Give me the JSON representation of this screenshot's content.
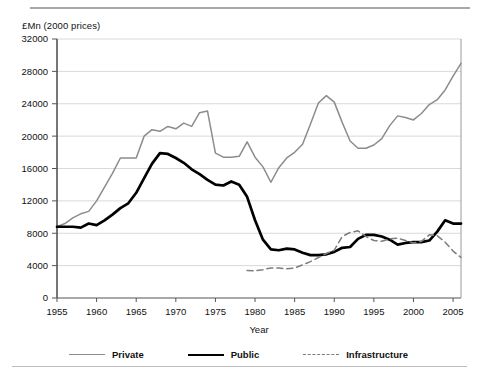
{
  "figure": {
    "y_axis_unit_label": "£Mn (2000 prices)",
    "x_axis_title": "Year"
  },
  "legend": {
    "position": "bottom",
    "items": [
      {
        "label": "Private",
        "color": "#8c8c8c",
        "style": "solid",
        "icon": "line-swatch-icon"
      },
      {
        "label": "Public",
        "color": "#000000",
        "style": "solid-bold",
        "icon": "line-swatch-icon"
      },
      {
        "label": "Infrastructure",
        "color": "#7d7d7d",
        "style": "dashed",
        "icon": "dashed-line-swatch-icon"
      }
    ]
  },
  "chart_data": {
    "type": "line",
    "title": "",
    "subtitle": "",
    "xlabel": "Year",
    "ylabel": "£Mn (2000 prices)",
    "xlim": [
      1955,
      2006
    ],
    "ylim": [
      0,
      32000
    ],
    "ytick_step": 4000,
    "yticks": [
      0,
      4000,
      8000,
      12000,
      16000,
      20000,
      24000,
      28000,
      32000
    ],
    "xticks": [
      1955,
      1960,
      1965,
      1970,
      1975,
      1980,
      1985,
      1990,
      1995,
      2000,
      2005
    ],
    "grid": "horizontal",
    "legend_position": "bottom",
    "series": [
      {
        "name": "Private",
        "color": "#8c8c8c",
        "style": "solid",
        "x": [
          1955,
          1956,
          1957,
          1958,
          1959,
          1960,
          1961,
          1962,
          1963,
          1964,
          1965,
          1966,
          1967,
          1968,
          1969,
          1970,
          1971,
          1972,
          1973,
          1974,
          1975,
          1976,
          1977,
          1978,
          1979,
          1980,
          1981,
          1982,
          1983,
          1984,
          1985,
          1986,
          1987,
          1988,
          1989,
          1990,
          1991,
          1992,
          1993,
          1994,
          1995,
          1996,
          1997,
          1998,
          1999,
          2000,
          2001,
          2002,
          2003,
          2004,
          2005,
          2006
        ],
        "y": [
          8800,
          9200,
          9900,
          10400,
          10700,
          12000,
          13700,
          15400,
          17300,
          17300,
          17300,
          20000,
          20800,
          20600,
          21200,
          20900,
          21600,
          21200,
          22900,
          23100,
          17900,
          17400,
          17400,
          17500,
          19300,
          17400,
          16200,
          14300,
          16100,
          17300,
          18000,
          19000,
          21500,
          24100,
          25000,
          24200,
          21700,
          19400,
          18500,
          18500,
          18900,
          19700,
          21300,
          22500,
          22300,
          22000,
          22800,
          23900,
          24500,
          25700,
          27400,
          29000
        ]
      },
      {
        "name": "Public",
        "color": "#000000",
        "style": "solid-bold",
        "x": [
          1955,
          1956,
          1957,
          1958,
          1959,
          1960,
          1961,
          1962,
          1963,
          1964,
          1965,
          1966,
          1967,
          1968,
          1969,
          1970,
          1971,
          1972,
          1973,
          1974,
          1975,
          1976,
          1977,
          1978,
          1979,
          1980,
          1981,
          1982,
          1983,
          1984,
          1985,
          1986,
          1987,
          1988,
          1989,
          1990,
          1991,
          1992,
          1993,
          1994,
          1995,
          1996,
          1997,
          1998,
          1999,
          2000,
          2001,
          2002,
          2003,
          2004,
          2005,
          2006
        ],
        "y": [
          8800,
          8800,
          8800,
          8700,
          9200,
          9000,
          9600,
          10300,
          11100,
          11700,
          13000,
          14800,
          16600,
          17900,
          17800,
          17300,
          16700,
          15900,
          15300,
          14600,
          14000,
          13900,
          14400,
          14000,
          12500,
          9600,
          7200,
          6000,
          5900,
          6100,
          6000,
          5600,
          5300,
          5300,
          5400,
          5700,
          6200,
          6300,
          7300,
          7800,
          7800,
          7600,
          7200,
          6600,
          6800,
          6900,
          6900,
          7100,
          8200,
          9600,
          9200,
          9200
        ]
      },
      {
        "name": "Infrastructure",
        "color": "#7d7d7d",
        "style": "dashed",
        "x": [
          1979,
          1980,
          1981,
          1982,
          1983,
          1984,
          1985,
          1986,
          1987,
          1988,
          1989,
          1990,
          1991,
          1992,
          1993,
          1994,
          1995,
          1996,
          1997,
          1998,
          1999,
          2000,
          2001,
          2002,
          2003,
          2004,
          2005,
          2006
        ],
        "y": [
          3400,
          3350,
          3500,
          3700,
          3700,
          3600,
          3700,
          4100,
          4500,
          5000,
          5500,
          5900,
          7600,
          8100,
          8300,
          7600,
          7100,
          7000,
          7300,
          7400,
          7100,
          6800,
          7000,
          7800,
          7700,
          6900,
          5800,
          5000
        ]
      }
    ]
  }
}
